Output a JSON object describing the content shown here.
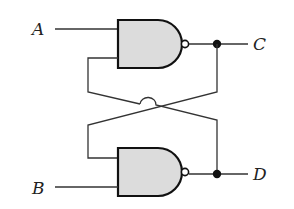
{
  "diagram": {
    "type": "cross-coupled NAND latch",
    "inputs": [
      {
        "label": "A"
      },
      {
        "label": "B"
      }
    ],
    "outputs": [
      {
        "label": "C"
      },
      {
        "label": "D"
      }
    ],
    "gates": [
      {
        "id": "top-nand",
        "type": "NAND",
        "inputs": [
          "A",
          "D"
        ],
        "output": "C"
      },
      {
        "id": "bottom-nand",
        "type": "NAND",
        "inputs": [
          "C",
          "B"
        ],
        "output": "D"
      }
    ],
    "colors": {
      "gate_fill": "#dcdcdc",
      "stroke": "#111111",
      "background": "#ffffff"
    }
  }
}
